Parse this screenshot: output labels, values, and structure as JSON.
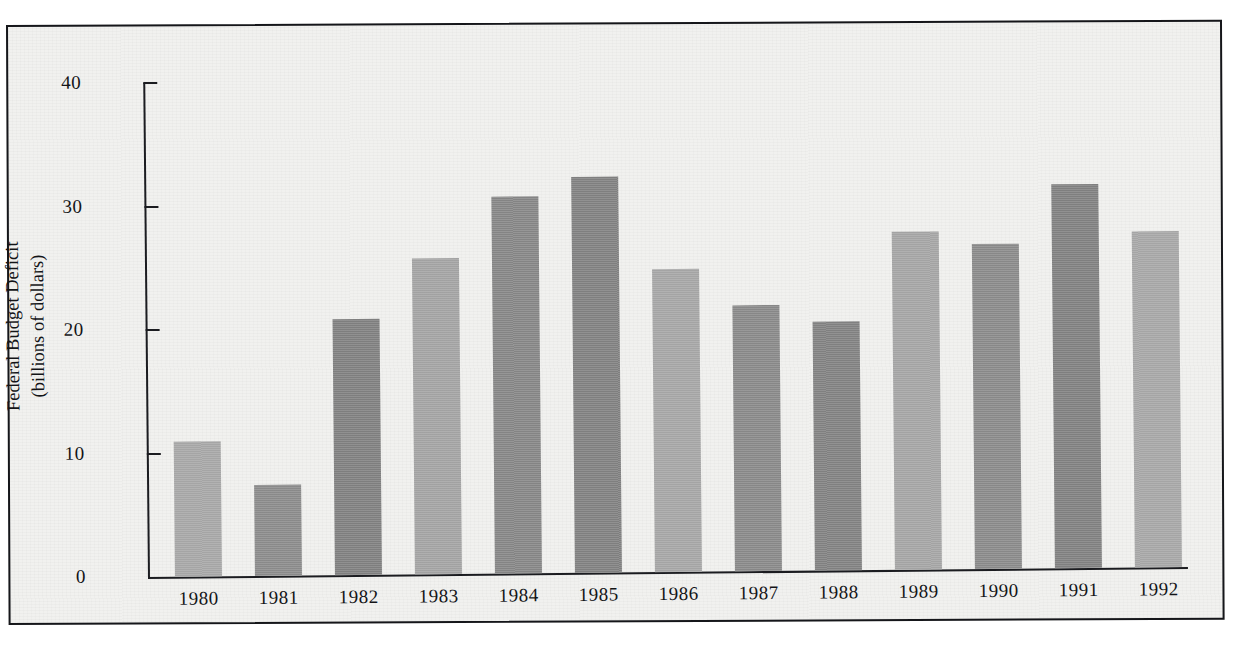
{
  "chart_data": {
    "type": "bar",
    "title": "",
    "xlabel": "",
    "ylabel": "Federal Budget Deficit\n(billions of dollars)",
    "ylabel_line1": "Federal Budget Deficit",
    "ylabel_line2": "(billions of dollars)",
    "categories": [
      "1980",
      "1981",
      "1982",
      "1983",
      "1984",
      "1985",
      "1986",
      "1987",
      "1988",
      "1989",
      "1990",
      "1991",
      "1992"
    ],
    "values": [
      10.9,
      7.4,
      20.7,
      25.6,
      30.5,
      32.1,
      24.5,
      21.5,
      20.2,
      27.4,
      26.3,
      31.1,
      27.2
    ],
    "ylim": [
      0,
      40
    ],
    "ytick_labels": [
      "0",
      "10",
      "20",
      "30",
      "40"
    ],
    "ytick_values": [
      0,
      10,
      20,
      30,
      40
    ],
    "grid": false,
    "legend": false,
    "bar_colors": [
      "#a9a9a9",
      "#8f8f8f",
      "#848484",
      "#a6a6a6",
      "#8a8a8a",
      "#858585",
      "#a8a8a8",
      "#8d8d8d",
      "#868686",
      "#a7a7a7",
      "#8e8e8e",
      "#858585",
      "#a9a9a9"
    ],
    "axis_color": "#1b1c20",
    "plot_background": "#f1f1ef"
  }
}
